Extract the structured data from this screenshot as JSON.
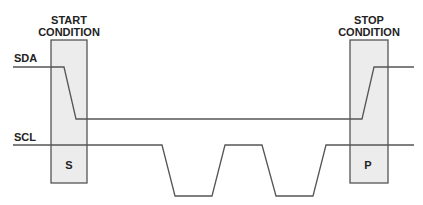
{
  "diagram": {
    "type": "timing-diagram",
    "colors": {
      "line": "#555555",
      "box_fill": "#ececec",
      "text": "#222222",
      "background": "#ffffff"
    },
    "signals": [
      {
        "name": "SDA",
        "label": "SDA"
      },
      {
        "name": "SCL",
        "label": "SCL"
      }
    ],
    "regions": [
      {
        "name": "start",
        "title_line1": "START",
        "title_line2": "CONDITION",
        "marker": "S"
      },
      {
        "name": "stop",
        "title_line1": "STOP",
        "title_line2": "CONDITION",
        "marker": "P"
      }
    ]
  }
}
